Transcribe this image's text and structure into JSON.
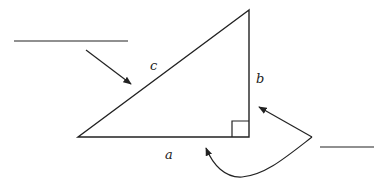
{
  "diagram": {
    "type": "right-triangle-labeling",
    "colors": {
      "stroke": "#222222",
      "background": "#ffffff"
    },
    "triangle": {
      "vertices": {
        "top": [
          249,
          10
        ],
        "bottom_left": [
          78,
          137
        ],
        "right_angle": [
          249,
          137
        ]
      },
      "right_angle_marker": true
    },
    "labels": {
      "hypotenuse": "c",
      "vertical_leg": "b",
      "horizontal_leg": "a"
    },
    "blanks": [
      {
        "id": "blank-hypotenuse",
        "points_to": "hypotenuse c",
        "text": ""
      },
      {
        "id": "blank-legs",
        "points_to": "legs a and b",
        "text": ""
      }
    ]
  }
}
